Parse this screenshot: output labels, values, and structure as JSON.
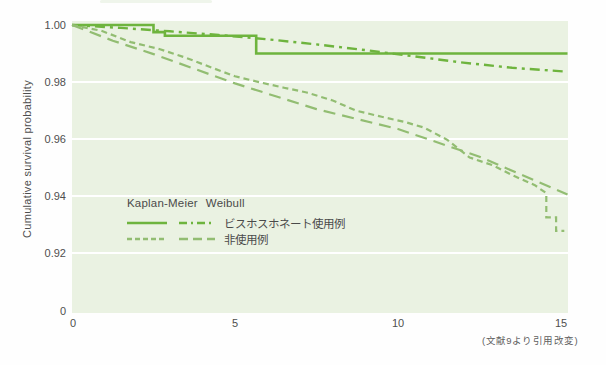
{
  "colors": {
    "use_series": "#6eb43e",
    "nonuse_series": "#92bd72",
    "plot_bg": "#eaf2e2",
    "gridline": "#ffffff",
    "text": "#4f4f4f"
  },
  "y_axis": {
    "title": "Cumulative survival probability"
  },
  "legend": {
    "col1": "Kaplan-Meier",
    "col2": "Weibull",
    "rows": [
      {
        "label": "ビスホスホネート使用例"
      },
      {
        "label": "非使用例"
      }
    ]
  },
  "caption": "(文献9より引用改変)",
  "chart_data": {
    "type": "line",
    "title": "",
    "xlabel": "",
    "ylabel": "Cumulative survival probability",
    "xlim": [
      0,
      15.3
    ],
    "ylim": [
      0.915,
      1.0
    ],
    "yticks": [
      1.0,
      0.98,
      0.96,
      0.94,
      0.92,
      0
    ],
    "xticks": [
      0,
      5,
      10,
      15
    ],
    "grid": "horizontal-white",
    "legend_position": "inside-lower-left",
    "y_axis_break": "between 0.92 and 0",
    "series": [
      {
        "name": "ビスホスホネート使用例 (Kaplan-Meier)",
        "group": "ビスホスホネート使用例",
        "model": "Kaplan-Meier",
        "style": "solid",
        "color": "#6eb43e",
        "points": [
          [
            0,
            1.0
          ],
          [
            2.5,
            1.0
          ],
          [
            2.5,
            0.9975
          ],
          [
            2.85,
            0.9975
          ],
          [
            2.85,
            0.9962
          ],
          [
            5.65,
            0.9962
          ],
          [
            5.65,
            0.99
          ],
          [
            15.2,
            0.99
          ]
        ]
      },
      {
        "name": "ビスホスホネート使用例 (Weibull)",
        "group": "ビスホスホネート使用例",
        "model": "Weibull",
        "style": "dashdot",
        "color": "#6eb43e",
        "points": [
          [
            0,
            1.0
          ],
          [
            1.5,
            0.999
          ],
          [
            3,
            0.9978
          ],
          [
            4.5,
            0.9965
          ],
          [
            6,
            0.995
          ],
          [
            7.5,
            0.9932
          ],
          [
            9,
            0.9912
          ],
          [
            10.5,
            0.989
          ],
          [
            12,
            0.9868
          ],
          [
            13.5,
            0.985
          ],
          [
            15.2,
            0.9836
          ]
        ]
      },
      {
        "name": "非使用例 (Kaplan-Meier)",
        "group": "非使用例",
        "model": "Kaplan-Meier",
        "style": "shortdash",
        "color": "#92bd72",
        "points": [
          [
            0,
            1.0
          ],
          [
            0.9,
            0.998
          ],
          [
            1.8,
            0.994
          ],
          [
            2.7,
            0.9915
          ],
          [
            3.5,
            0.9885
          ],
          [
            4.3,
            0.985
          ],
          [
            5,
            0.982
          ],
          [
            5.8,
            0.9798
          ],
          [
            6.5,
            0.978
          ],
          [
            7.2,
            0.9763
          ],
          [
            8,
            0.9735
          ],
          [
            8.7,
            0.97
          ],
          [
            9.5,
            0.9678
          ],
          [
            10.2,
            0.966
          ],
          [
            10.8,
            0.964
          ],
          [
            11.5,
            0.9598
          ],
          [
            12.2,
            0.9535
          ],
          [
            12.9,
            0.9508
          ],
          [
            13.6,
            0.9468
          ],
          [
            14.2,
            0.9438
          ],
          [
            14.55,
            0.941
          ],
          [
            14.55,
            0.9325
          ],
          [
            14.85,
            0.9325
          ],
          [
            14.85,
            0.9278
          ],
          [
            15.1,
            0.9278
          ]
        ]
      },
      {
        "name": "非使用例 (Weibull)",
        "group": "非使用例",
        "model": "Weibull",
        "style": "longdash",
        "color": "#92bd72",
        "points": [
          [
            0,
            1.0
          ],
          [
            1.25,
            0.9945
          ],
          [
            2.5,
            0.9898
          ],
          [
            5,
            0.9795
          ],
          [
            7.5,
            0.9705
          ],
          [
            10,
            0.9635
          ],
          [
            12.5,
            0.9538
          ],
          [
            15.2,
            0.9405
          ]
        ]
      }
    ]
  }
}
